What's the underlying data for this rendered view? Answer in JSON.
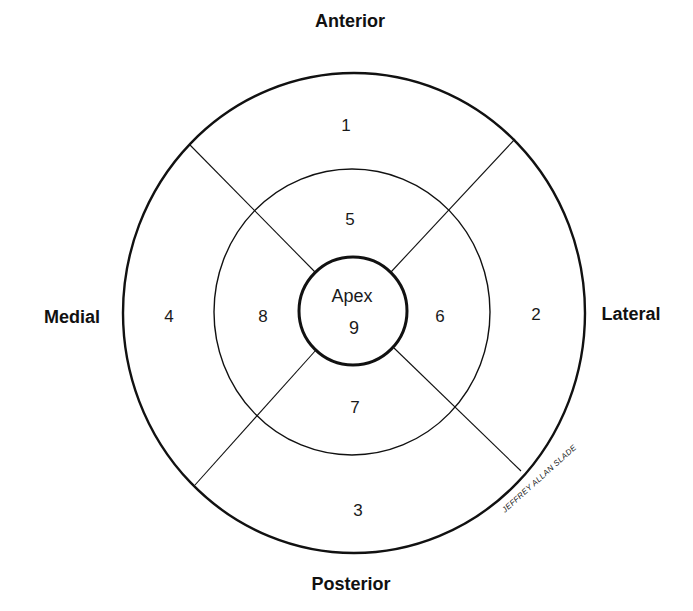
{
  "diagram": {
    "type": "bullseye segment map",
    "orientation_labels": {
      "top": "Anterior",
      "bottom": "Posterior",
      "left": "Medial",
      "right": "Lateral"
    },
    "rings": [
      {
        "name": "outer",
        "segments": [
          {
            "id": "1",
            "position": "anterior"
          },
          {
            "id": "2",
            "position": "lateral"
          },
          {
            "id": "3",
            "position": "posterior"
          },
          {
            "id": "4",
            "position": "medial"
          }
        ]
      },
      {
        "name": "middle",
        "segments": [
          {
            "id": "5",
            "position": "anterior"
          },
          {
            "id": "6",
            "position": "lateral"
          },
          {
            "id": "7",
            "position": "posterior"
          },
          {
            "id": "8",
            "position": "medial"
          }
        ]
      },
      {
        "name": "apex",
        "label": "Apex",
        "segments": [
          {
            "id": "9",
            "position": "center"
          }
        ]
      }
    ],
    "signature": "JEFFREY ALLAN SLADE",
    "colors": {
      "line": "#111111",
      "background": "#ffffff"
    }
  }
}
